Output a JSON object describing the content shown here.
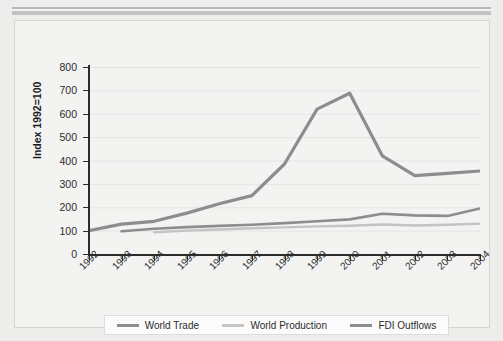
{
  "chart_data": {
    "type": "line",
    "title": "",
    "xlabel": "",
    "ylabel": "Index 1992=100",
    "categories": [
      "1992",
      "1993",
      "1994",
      "1995",
      "1996",
      "1997",
      "1998",
      "1999",
      "2000",
      "2001",
      "2002",
      "2003",
      "2004"
    ],
    "ylim": [
      0,
      800
    ],
    "yticks": [
      0,
      100,
      200,
      300,
      400,
      500,
      600,
      700,
      800
    ],
    "grid": true,
    "legend_position": "bottom",
    "series": [
      {
        "name": "World Trade",
        "color": "#8d8d8d",
        "values": [
          null,
          97,
          108,
          115,
          120,
          125,
          132,
          140,
          148,
          172,
          165,
          163,
          195
        ]
      },
      {
        "name": "World Production",
        "color": "#c3c3c3",
        "values": [
          null,
          null,
          93,
          100,
          105,
          110,
          114,
          118,
          121,
          126,
          122,
          125,
          130
        ]
      },
      {
        "name": "FDI Outflows",
        "color": "#8d8d8d",
        "values": [
          100,
          128,
          140,
          175,
          215,
          250,
          385,
          620,
          688,
          420,
          335,
          345,
          355
        ]
      }
    ]
  },
  "legend": {
    "items": [
      {
        "label": "World Trade",
        "color": "#8d8d8d"
      },
      {
        "label": "World Production",
        "color": "#c6c6c6"
      },
      {
        "label": "FDI Outflows",
        "color": "#8d8d8d"
      }
    ]
  },
  "axis": {
    "y_title": "Index 1992=100"
  }
}
